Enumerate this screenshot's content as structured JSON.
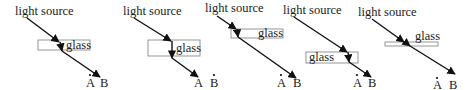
{
  "figure": {
    "panels": [
      {
        "id": 1,
        "source_label": "light source",
        "glass_label": "glass",
        "point_a": "A",
        "point_b": "B",
        "ray_ends_at": "B"
      },
      {
        "id": 2,
        "source_label": "light source",
        "glass_label": "glass",
        "point_a": "A",
        "point_b": "B",
        "ray_ends_at": "A"
      },
      {
        "id": 3,
        "source_label": "light source",
        "glass_label": "glass",
        "point_a": "A",
        "point_b": "B",
        "ray_ends_at": "B"
      },
      {
        "id": 4,
        "source_label": "light source",
        "glass_label": "glass",
        "point_a": "A",
        "point_b": "B",
        "ray_ends_at": "B"
      },
      {
        "id": 5,
        "source_label": "light source",
        "glass_label": "glass",
        "point_a": "A",
        "point_b": "B",
        "ray_ends_at": "B"
      }
    ]
  },
  "colors": {
    "ray": "#111111",
    "glass_border": "#8a8a8a",
    "background": "#ffffff"
  }
}
